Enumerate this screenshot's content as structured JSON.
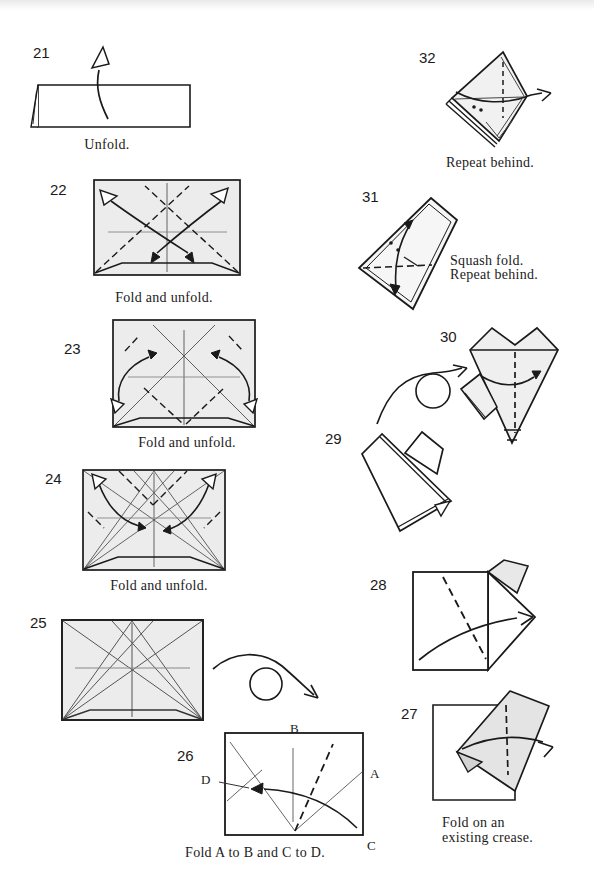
{
  "colors": {
    "paper_shaded": "#ececec",
    "paper_white": "#ffffff",
    "flap_gray": "#e4e4e4",
    "line": "#1a1a1a",
    "thin_crease": "#555555"
  },
  "steps": {
    "s21": {
      "num": "21",
      "caption": "Unfold."
    },
    "s22": {
      "num": "22",
      "caption": "Fold and unfold."
    },
    "s23": {
      "num": "23",
      "caption": "Fold and unfold."
    },
    "s24": {
      "num": "24",
      "caption": "Fold and unfold."
    },
    "s25": {
      "num": "25"
    },
    "s26": {
      "num": "26",
      "caption": "Fold A to B and C to D.",
      "labels": {
        "a": "A",
        "b": "B",
        "c": "C",
        "d": "D"
      }
    },
    "s27": {
      "num": "27",
      "caption_line1": "Fold on an",
      "caption_line2": "existing crease."
    },
    "s28": {
      "num": "28"
    },
    "s29": {
      "num": "29"
    },
    "s30": {
      "num": "30"
    },
    "s31": {
      "num": "31",
      "caption_line1": "Squash fold.",
      "caption_line2": "Repeat behind."
    },
    "s32": {
      "num": "32",
      "caption": "Repeat behind."
    }
  }
}
